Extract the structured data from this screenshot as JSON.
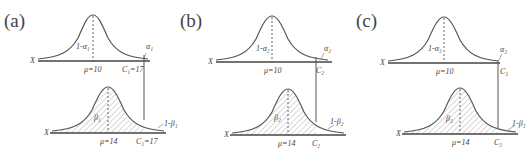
{
  "panels": [
    {
      "label": "(a)",
      "top": {
        "axis": "X",
        "center_label": "μ=10",
        "body_label": "1-α₁",
        "tail_label": "α₁",
        "crit_label": "C₁=17"
      },
      "bottom": {
        "axis": "X",
        "center_label": "μ=14",
        "body_label": "β₁",
        "tail_label": "1-β₁",
        "crit_label": "C₁=17"
      }
    },
    {
      "label": "(b)",
      "top": {
        "axis": "X",
        "center_label": "μ=10",
        "body_label": "1-α₂",
        "tail_label": "α₂",
        "crit_label": "C₂"
      },
      "bottom": {
        "axis": "X",
        "center_label": "μ=14",
        "body_label": "β₂",
        "tail_label": "1-β₂",
        "crit_label": "C₂"
      }
    },
    {
      "label": "(c)",
      "top": {
        "axis": "X",
        "center_label": "μ=10",
        "body_label": "1-α₃",
        "tail_label": "α₃",
        "crit_label": "C₃"
      },
      "bottom": {
        "axis": "X",
        "center_label": "μ=14",
        "body_label": "β₃",
        "tail_label": "1-β₃",
        "crit_label": "C₃"
      }
    }
  ],
  "colors": {
    "curve": "#555555",
    "axis": "#444444",
    "hatch": "#9a9a9a"
  }
}
